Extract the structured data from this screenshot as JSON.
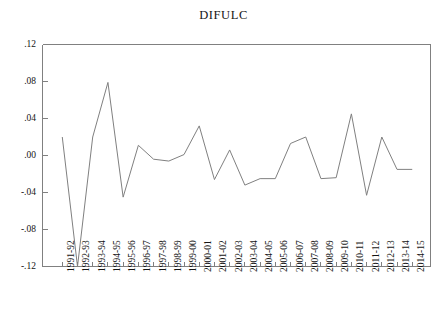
{
  "chart_data": {
    "type": "line",
    "title": "DIFULC",
    "xlabel": "",
    "ylabel": "",
    "grid": false,
    "legend": "none",
    "ylim": [
      -0.12,
      0.12
    ],
    "ytick_labels": [
      ".12",
      ".08",
      ".04",
      ".00",
      "-.04",
      "-.08",
      "-.12"
    ],
    "ytick_values": [
      0.12,
      0.08,
      0.04,
      0.0,
      -0.04,
      -0.08,
      -0.12
    ],
    "categories": [
      "1991-92",
      "1992-93",
      "1993-94",
      "1994-95",
      "1995-96",
      "1996-97",
      "1997-98",
      "1998-99",
      "1999-00",
      "2000-01",
      "2001-02",
      "2002-03",
      "2003-04",
      "2004-05",
      "2005-06",
      "2006-07",
      "2007-08",
      "2008-09",
      "2009-10",
      "2010-11",
      "2011-12",
      "2012-13",
      "2013-14",
      "2014-15"
    ],
    "values": [
      0.02,
      -0.12,
      0.02,
      0.079,
      -0.045,
      0.011,
      -0.004,
      -0.006,
      0.001,
      0.032,
      -0.026,
      0.006,
      -0.032,
      -0.025,
      -0.025,
      0.013,
      0.02,
      -0.025,
      -0.024,
      0.045,
      -0.043,
      0.02,
      -0.015,
      -0.015
    ],
    "series_name": "DIFULC",
    "line_color": "#808080",
    "axis_color": "#808080"
  }
}
